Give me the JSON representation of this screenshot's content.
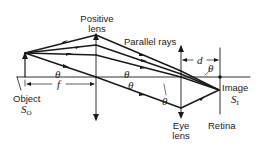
{
  "diagram": {
    "labels": {
      "positive_lens": [
        "Positive",
        "lens"
      ],
      "parallel_rays": "Parallel rays",
      "object": "Object",
      "object_symbol": "S",
      "object_subscript": "O",
      "image": "Image",
      "image_symbol": "S",
      "image_subscript": "I",
      "eye_lens": [
        "Eye",
        "lens"
      ],
      "retina": "Retina",
      "focal_length": "f",
      "distance": "d",
      "angle": "θ"
    },
    "colors": {
      "line": "#1a1a1a",
      "text": "#222222"
    }
  }
}
